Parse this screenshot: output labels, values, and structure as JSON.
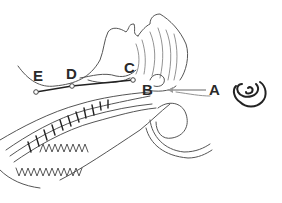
{
  "diagram": {
    "type": "anatomical-cross-section",
    "labels": {
      "A": "A",
      "B": "B",
      "C": "C",
      "D": "D",
      "E": "E"
    },
    "icon": "ear-icon",
    "colors": {
      "line": "#555555",
      "label": "#2a2a2a",
      "arrow": "#999999",
      "background": "#ffffff"
    }
  }
}
